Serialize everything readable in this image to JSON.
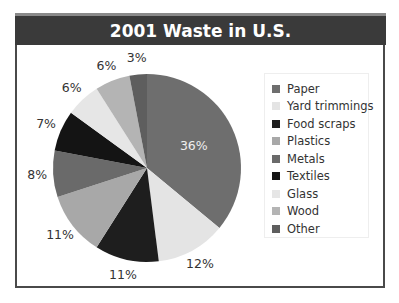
{
  "chart_data": {
    "type": "pie",
    "title": "2001 Waste in U.S.",
    "categories": [
      "Paper",
      "Yard trimmings",
      "Food scraps",
      "Plastics",
      "Metals",
      "Textiles",
      "Glass",
      "Wood",
      "Other"
    ],
    "values": [
      36,
      12,
      11,
      11,
      8,
      7,
      6,
      6,
      3
    ],
    "labels": [
      "36%",
      "12%",
      "11%",
      "11%",
      "8%",
      "7%",
      "6%",
      "6%",
      "3%"
    ],
    "colors": [
      "#6e6e6e",
      "#e4e4e4",
      "#1e1e1e",
      "#a8a8a8",
      "#6a6a6a",
      "#141414",
      "#e6e6e6",
      "#b4b4b4",
      "#5e5e5e"
    ],
    "start_angle": "12 o'clock",
    "direction": "clockwise",
    "legend_position": "right",
    "unit": "%"
  },
  "header": {
    "title": "2001 Waste in U.S."
  },
  "legend": {
    "items": [
      {
        "label": "Paper",
        "color": "#6e6e6e"
      },
      {
        "label": "Yard trimmings",
        "color": "#e4e4e4"
      },
      {
        "label": "Food scraps",
        "color": "#1e1e1e"
      },
      {
        "label": "Plastics",
        "color": "#a8a8a8"
      },
      {
        "label": "Metals",
        "color": "#6a6a6a"
      },
      {
        "label": "Textiles",
        "color": "#141414"
      },
      {
        "label": "Glass",
        "color": "#e6e6e6"
      },
      {
        "label": "Wood",
        "color": "#b4b4b4"
      },
      {
        "label": "Other",
        "color": "#5e5e5e"
      }
    ]
  }
}
